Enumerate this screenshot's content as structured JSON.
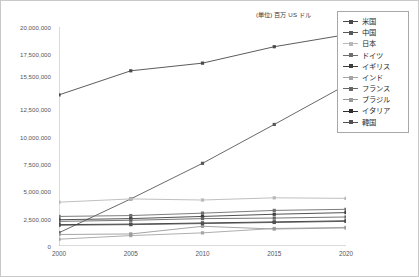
{
  "unit_caption": "(単位) 百万 US ドル",
  "legend": {
    "position": "right",
    "items": [
      {
        "label": "米国",
        "color": "#4a4a4a"
      },
      {
        "label": "中国",
        "color": "#585858"
      },
      {
        "label": "日本",
        "color": "#b8b8b8"
      },
      {
        "label": "ドイツ",
        "color": "#6e6e6e"
      },
      {
        "label": "イギリス",
        "color": "#3d3d3d"
      },
      {
        "label": "インド",
        "color": "#a5a5a5"
      },
      {
        "label": "フランス",
        "color": "#666666"
      },
      {
        "label": "ブラジル",
        "color": "#9a9a9a"
      },
      {
        "label": "イタリア",
        "color": "#2f2f2f"
      },
      {
        "label": "韓国",
        "color": "#515151"
      }
    ]
  },
  "axes": {
    "y_tick_labels": [
      "20,000,000",
      "17,500,000",
      "15,500,000",
      "12,500,000",
      "10,000,000",
      "7,500,000",
      "5,000,000",
      "2,500,000",
      "0"
    ],
    "x_tick_labels": [
      "2000",
      "2005",
      "2010",
      "2015",
      "2020"
    ]
  },
  "chart_data": {
    "type": "line",
    "title": "",
    "subtitle": "",
    "xlabel": "",
    "ylabel": "",
    "unit": "(単位) 百万 US ドル",
    "grid": false,
    "legend_position": "right",
    "x": [
      2000,
      2005,
      2010,
      2015,
      2020
    ],
    "categories": [
      "2000",
      "2005",
      "2010",
      "2015",
      "2020"
    ],
    "xlim": [
      2000,
      2020
    ],
    "ylim": [
      0,
      20000000
    ],
    "ytick_values": [
      20000000,
      17500000,
      15500000,
      12500000,
      10000000,
      7500000,
      5000000,
      2500000,
      0
    ],
    "series": [
      {
        "name": "米国",
        "color": "#4a4a4a",
        "values": [
          13800000,
          16000000,
          16700000,
          18200000,
          19300000
        ]
      },
      {
        "name": "中国",
        "color": "#585858",
        "values": [
          1210000,
          4300000,
          7550000,
          11100000,
          14700000
        ]
      },
      {
        "name": "日本",
        "color": "#b8b8b8",
        "values": [
          4000000,
          4300000,
          4200000,
          4400000,
          4350000
        ]
      },
      {
        "name": "ドイツ",
        "color": "#6e6e6e",
        "values": [
          2700000,
          2780000,
          3000000,
          3250000,
          3350000
        ]
      },
      {
        "name": "イギリス",
        "color": "#3d3d3d",
        "values": [
          2400000,
          2500000,
          2700000,
          2900000,
          3050000
        ]
      },
      {
        "name": "インド",
        "color": "#a5a5a5",
        "values": [
          620000,
          950000,
          1200000,
          1600000,
          1700000
        ]
      },
      {
        "name": "フランス",
        "color": "#666666",
        "values": [
          2250000,
          2350000,
          2500000,
          2550000,
          2650000
        ]
      },
      {
        "name": "ブラジル",
        "color": "#9a9a9a",
        "values": [
          1050000,
          1100000,
          1800000,
          1550000,
          1650000
        ]
      },
      {
        "name": "イタリア",
        "color": "#2f2f2f",
        "values": [
          1950000,
          2000000,
          2100000,
          2200000,
          2300000
        ]
      },
      {
        "name": "韓国",
        "color": "#515151",
        "values": [
          1900000,
          1950000,
          2050000,
          2150000,
          2250000
        ]
      }
    ]
  }
}
